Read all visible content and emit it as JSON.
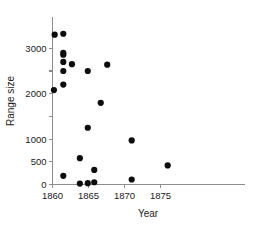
{
  "chart_data": {
    "type": "scatter",
    "title": "",
    "xlabel": "Year",
    "ylabel": "Range size",
    "xlim": [
      1859.2,
      1877.5
    ],
    "ylim": [
      -120,
      3450
    ],
    "grid": false,
    "legend": null,
    "xticks": [
      1860,
      1865,
      1870,
      1875
    ],
    "xtick_labels": [
      "1860",
      "1865",
      "1870",
      "1875"
    ],
    "yticks": [
      0,
      500,
      1000,
      1500,
      2000,
      2500,
      3000
    ],
    "ytick_labels": [
      "0",
      "500",
      "1000",
      "",
      "2000",
      "",
      "3000"
    ],
    "marker": "filled-circle",
    "marker_color": "#0d0d0d",
    "marker_size": 3.1,
    "series": [
      {
        "name": "observations",
        "points": [
          {
            "x": 1860.3,
            "y": 3300
          },
          {
            "x": 1861.5,
            "y": 3320
          },
          {
            "x": 1861.5,
            "y": 2900
          },
          {
            "x": 1861.5,
            "y": 2860
          },
          {
            "x": 1861.5,
            "y": 2700
          },
          {
            "x": 1861.5,
            "y": 2500
          },
          {
            "x": 1861.5,
            "y": 2200
          },
          {
            "x": 1860.2,
            "y": 2080
          },
          {
            "x": 1862.7,
            "y": 2650
          },
          {
            "x": 1864.9,
            "y": 2500
          },
          {
            "x": 1867.6,
            "y": 2640
          },
          {
            "x": 1866.7,
            "y": 1800
          },
          {
            "x": 1864.9,
            "y": 1250
          },
          {
            "x": 1871.0,
            "y": 970
          },
          {
            "x": 1876.0,
            "y": 420
          },
          {
            "x": 1863.8,
            "y": 580
          },
          {
            "x": 1861.5,
            "y": 190
          },
          {
            "x": 1865.8,
            "y": 320
          },
          {
            "x": 1863.8,
            "y": 20
          },
          {
            "x": 1864.9,
            "y": 30
          },
          {
            "x": 1865.8,
            "y": 50
          },
          {
            "x": 1871.0,
            "y": 110
          }
        ]
      }
    ]
  },
  "axes": {
    "x_title": "Year",
    "y_title": "Range size"
  },
  "colors": {
    "marker": "#0d0d0d",
    "axis": "#8c8c8c",
    "text": "#1a1a1a",
    "background": "#ffffff"
  }
}
